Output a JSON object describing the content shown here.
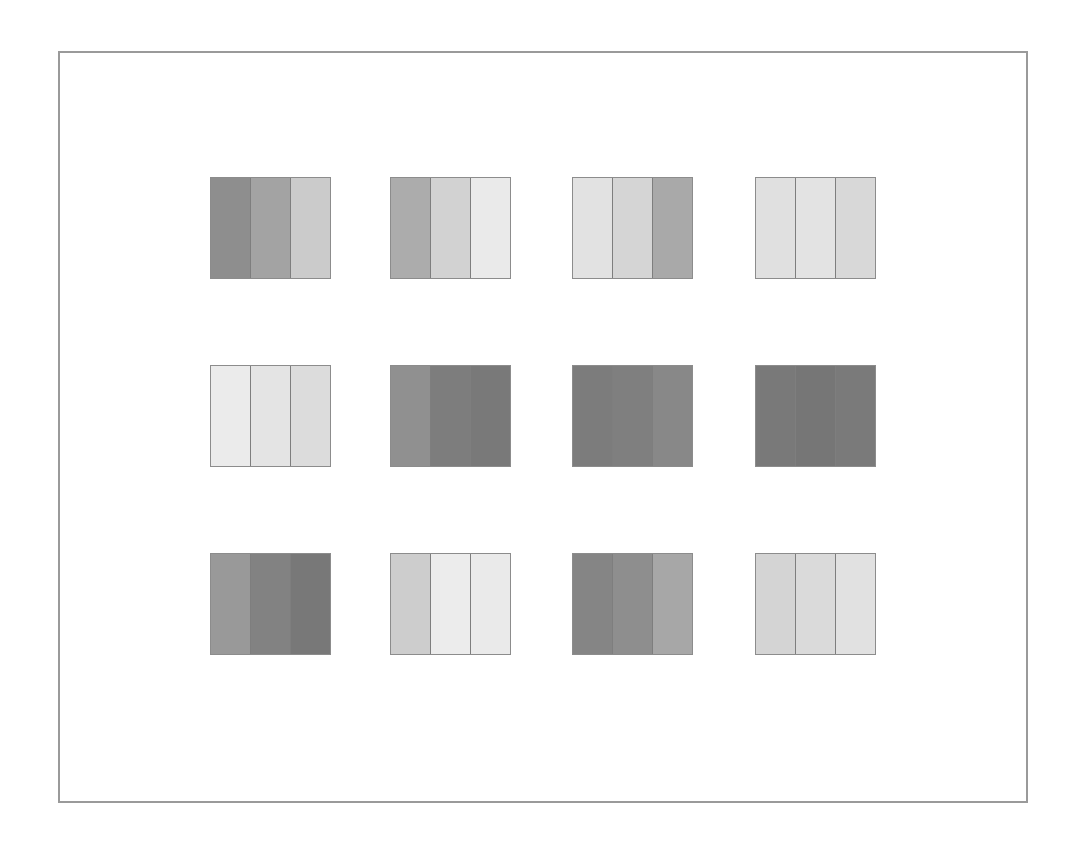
{
  "layout": {
    "frame": {
      "left": 58,
      "top": 51,
      "width": 970,
      "height": 752,
      "border_color": "#9a9a9a"
    },
    "swatch_size": {
      "width": 121,
      "height": 102
    },
    "column_lefts": [
      210,
      390,
      572,
      755
    ],
    "row_tops": [
      177,
      365,
      553
    ]
  },
  "swatches": [
    {
      "row": 0,
      "col": 0,
      "stripes": [
        "#8e8e8e",
        "#a3a3a3",
        "#cbcbcb"
      ]
    },
    {
      "row": 0,
      "col": 1,
      "stripes": [
        "#acacac",
        "#d2d2d2",
        "#eaeaea"
      ]
    },
    {
      "row": 0,
      "col": 2,
      "stripes": [
        "#e2e2e2",
        "#d5d5d5",
        "#a9a9a9"
      ]
    },
    {
      "row": 0,
      "col": 3,
      "stripes": [
        "#e0e0e0",
        "#e3e3e3",
        "#d8d8d8"
      ]
    },
    {
      "row": 1,
      "col": 0,
      "stripes": [
        "#ebebeb",
        "#e4e4e4",
        "#dcdcdc"
      ]
    },
    {
      "row": 1,
      "col": 1,
      "stripes": [
        "#909090",
        "#7d7d7d",
        "#797979"
      ]
    },
    {
      "row": 1,
      "col": 2,
      "stripes": [
        "#7c7c7c",
        "#7f7f7f",
        "#888888"
      ]
    },
    {
      "row": 1,
      "col": 3,
      "stripes": [
        "#797979",
        "#767676",
        "#7a7a7a"
      ]
    },
    {
      "row": 2,
      "col": 0,
      "stripes": [
        "#999999",
        "#828282",
        "#787878"
      ]
    },
    {
      "row": 2,
      "col": 1,
      "stripes": [
        "#cdcdcd",
        "#ececec",
        "#eaeaea"
      ]
    },
    {
      "row": 2,
      "col": 2,
      "stripes": [
        "#858585",
        "#8e8e8e",
        "#a7a7a7"
      ]
    },
    {
      "row": 2,
      "col": 3,
      "stripes": [
        "#d4d4d4",
        "#dadada",
        "#e1e1e1"
      ]
    }
  ]
}
